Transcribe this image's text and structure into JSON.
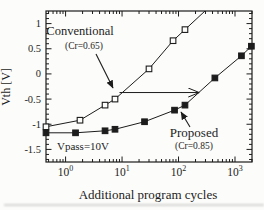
{
  "colors": {
    "ink": "#1c1c1c",
    "background": "#fcfcfb"
  },
  "chart_data": {
    "type": "line",
    "title": "",
    "xlabel": "Additional program cycles",
    "ylabel": "Vth [V]",
    "x_scale": "log",
    "xlim": [
      0.45,
      2000
    ],
    "ylim": [
      -1.75,
      1.25
    ],
    "grid": false,
    "x_ticks": [
      {
        "value": 1,
        "base": "10",
        "exp": "0"
      },
      {
        "value": 10,
        "base": "10",
        "exp": "1"
      },
      {
        "value": 100,
        "base": "10",
        "exp": "2"
      },
      {
        "value": 1000,
        "base": "10",
        "exp": "3"
      }
    ],
    "y_ticks": [
      {
        "value": 1,
        "label": "1"
      },
      {
        "value": 0.5,
        "label": "0.5"
      },
      {
        "value": 0,
        "label": "0"
      },
      {
        "value": -0.5,
        "label": "-0.5"
      },
      {
        "value": -1,
        "label": "-1"
      },
      {
        "value": -1.5,
        "label": "-1.5"
      }
    ],
    "y_minor_step": 0.1,
    "series": [
      {
        "name": "Conventional",
        "cr_label": "(Cr=0.65)",
        "marker": "open-square",
        "points": [
          [
            0.45,
            -1.05
          ],
          [
            1.8,
            -0.92
          ],
          [
            5,
            -0.62
          ],
          [
            7.5,
            -0.5
          ],
          [
            30,
            0.1
          ],
          [
            80,
            0.66
          ],
          [
            130,
            0.88
          ]
        ],
        "extends_beyond_top": true
      },
      {
        "name": "Proposed",
        "cr_label": "(Cr=0.85)",
        "marker": "filled-square",
        "points": [
          [
            0.45,
            -1.17
          ],
          [
            1.5,
            -1.17
          ],
          [
            5,
            -1.13
          ],
          [
            7.5,
            -1.1
          ],
          [
            25,
            -0.95
          ],
          [
            85,
            -0.72
          ],
          [
            130,
            -0.62
          ],
          [
            440,
            -0.08
          ],
          [
            1300,
            0.36
          ],
          [
            1950,
            0.55
          ]
        ]
      }
    ],
    "annotations": {
      "conventional": {
        "title": "Conventional",
        "subtitle": "(Cr=0.65)",
        "tx": 80,
        "ty": 35,
        "sx": 84,
        "sy": 49,
        "arrow": [
          96,
          54,
          113,
          88
        ]
      },
      "proposed": {
        "title": "Proposed",
        "subtitle": "(Cr=0.85)",
        "tx": 194,
        "ty": 137,
        "sx": 194,
        "sy": 149,
        "arrow": [
          190,
          127,
          181,
          112
        ]
      },
      "vpass": {
        "text": "Vpass=10V",
        "x": 57,
        "y": 150
      },
      "shift_arrow": {
        "x1_cycles": 9,
        "x2_cycles": 228,
        "vth": -0.37
      }
    }
  }
}
